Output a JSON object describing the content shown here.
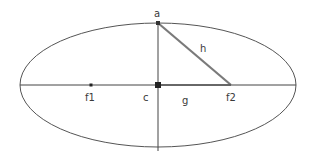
{
  "diagram": {
    "type": "ellipse-foci",
    "ellipse": {
      "cx": 158,
      "cy": 85,
      "rx": 138,
      "ry": 62,
      "stroke": "#555555"
    },
    "points": {
      "a": {
        "label": "a",
        "x": 158,
        "y": 23
      },
      "c": {
        "label": "c",
        "x": 158,
        "y": 85
      },
      "f1": {
        "label": "f1",
        "x": 91,
        "y": 85
      },
      "f2": {
        "label": "f2",
        "x": 231,
        "y": 85
      }
    },
    "segments": {
      "h": {
        "label": "h",
        "from": "a",
        "to": "f2",
        "stroke": "#7a7a7a"
      },
      "g": {
        "label": "g",
        "from": "c",
        "to": "f2"
      }
    },
    "axes": {
      "major": "horizontal",
      "minor": "vertical",
      "stroke": "#444444"
    }
  },
  "labels": {
    "a": "a",
    "c": "c",
    "f1": "f1",
    "f2": "f2",
    "g": "g",
    "h": "h"
  }
}
